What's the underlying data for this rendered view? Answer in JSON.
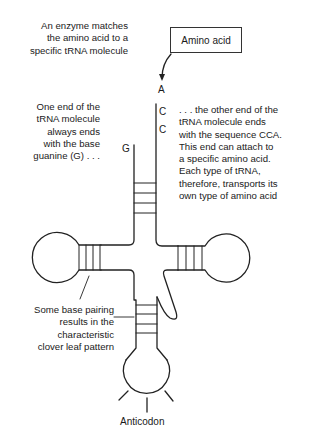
{
  "diagram": {
    "title_hint": "tRNA clover leaf structure",
    "amino_acid_box": {
      "label": "Amino acid"
    },
    "bases": {
      "top": "A",
      "mid1": "C",
      "mid2": "C",
      "left_end": "G"
    },
    "annotations": {
      "enzyme": [
        "An enzyme matches",
        "the amino acid to a",
        "specific tRNA molecule"
      ],
      "guanine_end": [
        "One end of the",
        "tRNA molecule",
        "always ends",
        "with the base",
        "guanine (G) . . ."
      ],
      "cca_end": [
        ". . . the other end of the",
        "tRNA molecule ends",
        "with the sequence CCA.",
        "This end can attach to",
        "a specific amino acid.",
        "Each type of tRNA,",
        "therefore, transports its",
        "own type of amino acid"
      ],
      "base_pairing": [
        "Some base pairing",
        "results in the",
        "characteristic",
        "clover leaf pattern"
      ],
      "anticodon": "Anticodon"
    },
    "colors": {
      "stroke": "#222222",
      "text": "#1a1a1a",
      "background": "#ffffff"
    }
  }
}
